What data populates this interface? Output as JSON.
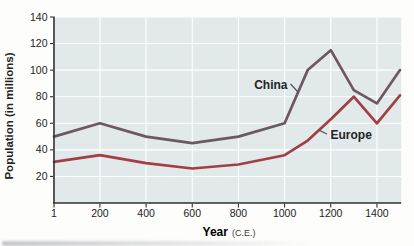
{
  "colors": {
    "china_line": "#6d5862",
    "europe_line": "#a23f44",
    "plot_background": "#e1e9eb",
    "gridline": "#ffffff",
    "axis": "#2f2f2f",
    "text": "#222222"
  },
  "chart_data": {
    "type": "line",
    "title": "",
    "xlabel": "Year",
    "xlabel_suffix": "(C.E.)",
    "ylabel": "Population (in millions)",
    "x": [
      1,
      200,
      400,
      600,
      800,
      1000,
      1100,
      1200,
      1300,
      1400,
      1500
    ],
    "series": [
      {
        "name": "China",
        "values": [
          50,
          60,
          50,
          45,
          50,
          60,
          100,
          115,
          85,
          75,
          100
        ]
      },
      {
        "name": "Europe",
        "values": [
          31,
          36,
          30,
          26,
          29,
          36,
          47,
          63,
          80,
          60,
          81
        ]
      }
    ],
    "x_ticks": [
      1,
      200,
      400,
      600,
      800,
      1000,
      1200,
      1400
    ],
    "y_ticks": [
      20,
      40,
      60,
      80,
      100,
      120,
      140
    ],
    "xlim": [
      1,
      1500
    ],
    "ylim": [
      0,
      140
    ],
    "grid": true,
    "legend_position": "inline-labels"
  }
}
